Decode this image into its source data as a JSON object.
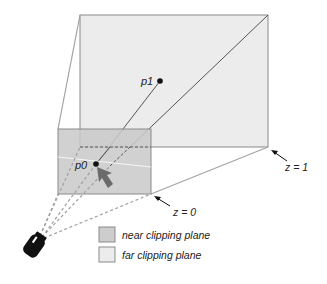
{
  "diagram": {
    "type": "view frustum",
    "points": {
      "p0": {
        "label": "p0"
      },
      "p1": {
        "label": "p1"
      }
    },
    "depth_labels": {
      "near": "z = 0",
      "far": "z = 1"
    },
    "legend": [
      {
        "label": "near clipping plane",
        "color": "#cdcdcd"
      },
      {
        "label": "far clipping plane",
        "color": "#ececec"
      }
    ],
    "colors": {
      "far_plane_fill": "#ececec",
      "near_plane_fill": "#c9c9c9",
      "edge": "#8a8a8a",
      "frustum_edge": "#a3a3a3",
      "ray": "#555555",
      "arrow": "#6b6b6b",
      "camera": "#111111"
    }
  }
}
